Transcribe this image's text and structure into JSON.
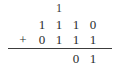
{
  "problem": {
    "type": "binary-addition",
    "operator": "+",
    "columns": 4,
    "carry_row": [
      "",
      "1",
      "",
      ""
    ],
    "addend_1": [
      "1",
      "1",
      "1",
      "0"
    ],
    "addend_2": [
      "0",
      "1",
      "1",
      "1"
    ],
    "sum_row": [
      "",
      "",
      "0",
      "1"
    ],
    "colors": {
      "ink": "#2b2b2b",
      "rule": "#3c3c3c",
      "background": "#ffffff"
    }
  }
}
